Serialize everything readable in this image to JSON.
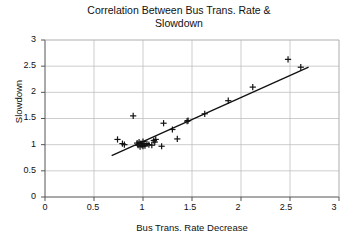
{
  "chart_data": {
    "type": "scatter",
    "title": "Correlation Between Bus Trans. Rate &\nSlowdown",
    "title_line1": "Correlation Between Bus Trans. Rate &",
    "title_line2": "Slowdown",
    "xlabel": "Bus Trans. Rate Decrease",
    "ylabel": "Slowdown",
    "xlim": [
      0,
      3
    ],
    "ylim": [
      0,
      3
    ],
    "xticks": [
      0,
      0.5,
      1,
      1.5,
      2,
      2.5,
      3
    ],
    "yticks": [
      0,
      0.5,
      1,
      1.5,
      2,
      2.5,
      3
    ],
    "xtick_labels": [
      "0",
      "0.5",
      "1",
      "1.5",
      "2",
      "2.5",
      "3"
    ],
    "ytick_labels": [
      "0",
      "0.5",
      "1",
      "1.5",
      "2",
      "2.5",
      "3"
    ],
    "grid": true,
    "grid_color": "#b8b8b8",
    "legend": "none",
    "marker": "plus",
    "marker_color": "#111111",
    "series": [
      {
        "name": "Observations",
        "points": [
          [
            0.74,
            1.1
          ],
          [
            0.79,
            1.02
          ],
          [
            0.81,
            1.0
          ],
          [
            0.9,
            1.55
          ],
          [
            0.94,
            1.03
          ],
          [
            0.95,
            0.99
          ],
          [
            0.96,
            1.05
          ],
          [
            0.97,
            0.96
          ],
          [
            0.98,
            1.02
          ],
          [
            0.99,
            0.99
          ],
          [
            1.0,
            1.06
          ],
          [
            1.0,
            0.97
          ],
          [
            1.01,
            1.01
          ],
          [
            1.02,
            0.98
          ],
          [
            1.04,
            1.02
          ],
          [
            1.06,
            1.0
          ],
          [
            1.09,
            0.99
          ],
          [
            1.11,
            1.08
          ],
          [
            1.12,
            1.05
          ],
          [
            1.13,
            1.1
          ],
          [
            1.19,
            0.97
          ],
          [
            1.21,
            1.41
          ],
          [
            1.3,
            1.29
          ],
          [
            1.35,
            1.11
          ],
          [
            1.45,
            1.45
          ],
          [
            1.46,
            1.46
          ],
          [
            1.63,
            1.59
          ],
          [
            1.87,
            1.84
          ],
          [
            2.12,
            2.1
          ],
          [
            2.48,
            2.63
          ],
          [
            2.61,
            2.48
          ]
        ]
      }
    ],
    "trendline": {
      "type": "linear",
      "x_start": 0.68,
      "y_start": 0.79,
      "x_end": 2.69,
      "y_end": 2.48,
      "color": "#111111"
    }
  }
}
